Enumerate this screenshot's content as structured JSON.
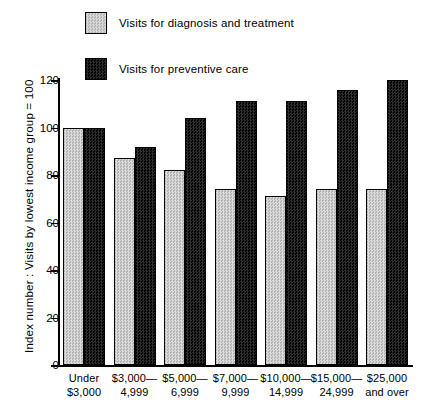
{
  "legend": {
    "items": [
      {
        "label": "Visits for diagnosis and treatment",
        "swatch": "light-checker-swatch",
        "color": "#c9c9c9"
      },
      {
        "label": "Visits for preventive care",
        "swatch": "dark-checker-swatch",
        "color": "#161616"
      }
    ]
  },
  "axes": {
    "ylabel": "Index number : Visits by lowest income group = 100",
    "yticks": [
      "0",
      "20",
      "40",
      "60",
      "80",
      "100",
      "120"
    ]
  },
  "chart_data": {
    "type": "bar",
    "title": "",
    "subtitle": "",
    "xlabel": "",
    "ylabel": "Index number : Visits by lowest income group = 100",
    "ylim": [
      0,
      120
    ],
    "yticks": [
      0,
      20,
      40,
      60,
      80,
      100,
      120
    ],
    "grid": false,
    "legend_position": "top-left",
    "categories": [
      "Under $3,000",
      "$3,000— 4,999",
      "$5,000— 6,999",
      "$7,000— 9,999",
      "$10,000— 14,999",
      "$15,000— 24,999",
      "$25,000 and over"
    ],
    "category_lines": [
      [
        "Under",
        "$3,000"
      ],
      [
        "$3,000—",
        "4,999"
      ],
      [
        "$5,000—",
        "6,999"
      ],
      [
        "$7,000—",
        "9,999"
      ],
      [
        "$10,000—",
        "14,999"
      ],
      [
        "$15,000—",
        "24,999"
      ],
      [
        "$25,000",
        "and over"
      ]
    ],
    "series": [
      {
        "name": "Visits for diagnosis and treatment",
        "color": "#c9c9c9",
        "values": [
          100,
          87,
          82,
          74,
          71,
          74,
          74
        ]
      },
      {
        "name": "Visits for preventive care",
        "color": "#161616",
        "values": [
          100,
          92,
          104,
          111,
          111,
          116,
          120
        ]
      }
    ]
  }
}
